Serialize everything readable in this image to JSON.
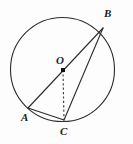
{
  "figure": {
    "name": "circle-with-inscribed-angle",
    "background_color": "#fdfdfd",
    "stroke_color": "#2b2b2b",
    "label_color": "#1b1b1b",
    "width": 133,
    "height": 144
  },
  "circle": {
    "name": "main-circle",
    "center_x": 62.5,
    "center_y": 69.5,
    "radius": 52,
    "stroke_width": 1.1
  },
  "center_point": {
    "name": "center-marker",
    "x": 63,
    "y": 70,
    "marker": "filled-square",
    "size": 4
  },
  "points": [
    {
      "id": "B",
      "label": "B",
      "x": 103,
      "y": 28,
      "label_x": 104,
      "label_y": 8
    },
    {
      "id": "O",
      "label": "O",
      "x": 63,
      "y": 70,
      "label_x": 56,
      "label_y": 55
    },
    {
      "id": "A",
      "label": "A",
      "x": 28,
      "y": 108,
      "label_x": 21,
      "label_y": 112
    },
    {
      "id": "C",
      "label": "C",
      "x": 64,
      "y": 120,
      "label_x": 60,
      "label_y": 126
    }
  ],
  "segments": [
    {
      "name": "chord-A-B",
      "from": "A",
      "to": "B",
      "style": "solid",
      "x1": 28,
      "y1": 108,
      "x2": 103,
      "y2": 28
    },
    {
      "name": "chord-B-C",
      "from": "B",
      "to": "C",
      "style": "solid",
      "x1": 103,
      "y1": 28,
      "x2": 64,
      "y2": 120
    },
    {
      "name": "chord-A-C",
      "from": "A",
      "to": "C",
      "style": "solid",
      "x1": 28,
      "y1": 108,
      "x2": 64,
      "y2": 120
    },
    {
      "name": "radius-O-C",
      "from": "O",
      "to": "C",
      "style": "dashed",
      "x1": 63,
      "y1": 70,
      "x2": 64,
      "y2": 120
    }
  ],
  "labels": {
    "B": "B",
    "O": "O",
    "A": "A",
    "C": "C"
  }
}
